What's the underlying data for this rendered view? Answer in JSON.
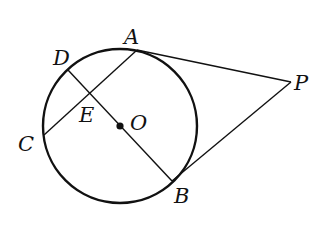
{
  "diagram": {
    "type": "geometry",
    "stroke_color": "#111111",
    "background": "#ffffff",
    "circle": {
      "center_label": "O",
      "cx": 120,
      "cy": 126,
      "r": 77
    },
    "points": [
      {
        "label": "A",
        "x": 137,
        "y": 50,
        "lx": 124,
        "ly": 44
      },
      {
        "label": "B",
        "x": 172,
        "y": 181,
        "lx": 174,
        "ly": 203
      },
      {
        "label": "C",
        "x": 44,
        "y": 135,
        "lx": 18,
        "ly": 151
      },
      {
        "label": "D",
        "x": 68,
        "y": 70,
        "lx": 53,
        "ly": 65
      },
      {
        "label": "E",
        "x": 91,
        "y": 93,
        "lx": 79,
        "ly": 122
      },
      {
        "label": "O",
        "x": 120,
        "y": 126,
        "lx": 130,
        "ly": 130
      },
      {
        "label": "P",
        "x": 291,
        "y": 82,
        "lx": 294,
        "ly": 90
      }
    ],
    "segments": [
      {
        "from": "A",
        "to": "P"
      },
      {
        "from": "B",
        "to": "P"
      },
      {
        "from": "A",
        "to": "C"
      },
      {
        "from": "D",
        "to": "B"
      }
    ]
  }
}
